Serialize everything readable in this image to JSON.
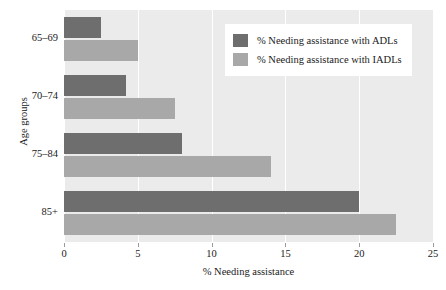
{
  "chart_data": {
    "type": "bar",
    "orientation": "horizontal",
    "title": "",
    "xlabel": "% Needing assistance",
    "ylabel": "Age groups",
    "categories": [
      "65–69",
      "70–74",
      "75–84",
      "85+"
    ],
    "series": [
      {
        "name": "% Needing assistance with ADLs",
        "color": "#6e6e6e",
        "values": [
          2.5,
          4.2,
          8.0,
          20.0
        ]
      },
      {
        "name": "% Needing assistance with IADLs",
        "color": "#a8a8a8",
        "values": [
          5.0,
          7.5,
          14.0,
          22.5
        ]
      }
    ],
    "xlim": [
      0,
      25
    ],
    "xticks": [
      0,
      5,
      10,
      15,
      20,
      25
    ],
    "xtick_labels": [
      "0",
      "5",
      "10",
      "15",
      "20",
      "25"
    ],
    "grid": true,
    "grid_axis": "x",
    "grid_color": "#ffffff",
    "plot_background": "#ebebeb",
    "figure_background": "#ffffff",
    "legend_position": "upper right"
  },
  "legend": {
    "entries": [
      {
        "label": "% Needing assistance with ADLs",
        "color": "#6e6e6e"
      },
      {
        "label": "% Needing assistance with IADLs",
        "color": "#a8a8a8"
      }
    ]
  },
  "axes": {
    "x_title": "% Needing assistance",
    "y_title": "Age groups",
    "x_tick_labels": [
      "0",
      "5",
      "10",
      "15",
      "20",
      "25"
    ],
    "y_tick_labels": [
      "65–69",
      "70–74",
      "75–84",
      "85+"
    ]
  }
}
